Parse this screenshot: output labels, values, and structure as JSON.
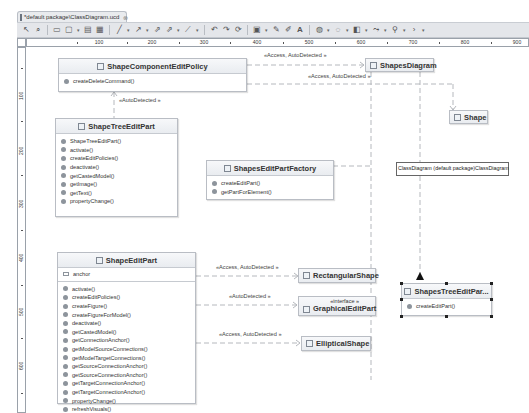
{
  "editor": {
    "tab_title": "*default package\\ClassDiagram.ucd",
    "tab_close": "⊗"
  },
  "toolbar": {
    "buttons": [
      "select-icon",
      "zoom-icon",
      "rectangle-icon",
      "note-icon",
      "dropdown",
      "class-icon",
      "package-icon",
      "line-icon",
      "dropdown",
      "arrow-icon",
      "dropdown",
      "association-icon",
      "inheritance-icon",
      "dropdown",
      "dependency-icon",
      "dropdown",
      "undo-icon",
      "redo-icon",
      "refresh-icon",
      "layout-icon",
      "dropdown",
      "pen-icon",
      "brush-icon",
      "font-icon",
      "fill-icon",
      "dropdown",
      "line-color-icon",
      "dropdown",
      "layer-icon",
      "dropdown",
      "route-icon",
      "dropdown",
      "arrange-icon",
      "dropdown",
      "more-icon"
    ]
  },
  "rulers": {
    "horizontal": [
      "100",
      "200",
      "300",
      "400",
      "500",
      "600",
      "700",
      "800",
      "900"
    ],
    "vertical": [
      "100",
      "200",
      "300",
      "400",
      "500",
      "600"
    ]
  },
  "classes": {
    "shape_component_edit_policy": {
      "name": "ShapeComponentEditPolicy",
      "methods": [
        "createDeleteCommand()"
      ]
    },
    "shape_tree_edit_part": {
      "name": "ShapeTreeEditPart",
      "methods": [
        "ShapeTreeEditPart()",
        "activate()",
        "createEditPolicies()",
        "deactivate()",
        "getCastedModel()",
        "getImage()",
        "getText()",
        "propertyChange()"
      ]
    },
    "shapes_edit_part_factory": {
      "name": "ShapesEditPartFactory",
      "methods": [
        "createEditPart()",
        "getPartForElement()"
      ]
    },
    "shape_edit_part": {
      "name": "ShapeEditPart",
      "fields": [
        "anchor"
      ],
      "methods": [
        "activate()",
        "createEditPolicies()",
        "createFigure()",
        "createFigureForModel()",
        "deactivate()",
        "getCastedModel()",
        "getConnectionAnchor()",
        "getModelSourceConnections()",
        "getModelTargetConnections()",
        "getSourceConnectionAnchor()",
        "getSourceConnectionAnchor()",
        "getTargetConnectionAnchor()",
        "getTargetConnectionAnchor()",
        "propertyChange()",
        "refreshVisuals()"
      ]
    },
    "shapes_tree_edit_part": {
      "name": "ShapesTreeEditPar...",
      "methods": [
        "createEditPart()"
      ]
    },
    "shapes_diagram": {
      "name": "ShapesDiagram"
    },
    "shape": {
      "name": "Shape"
    },
    "rectangular_shape": {
      "name": "RectangularShape"
    },
    "graphical_edit_part": {
      "name": "GraphicalEditPart",
      "stereotype": "«interface »"
    },
    "elliptical_shape": {
      "name": "EllipticalShape"
    }
  },
  "edge_labels": {
    "policy_to_diagram": "«Access, AutoDetected »",
    "tree_to_shape": "«Access, AutoDetected »",
    "tree_to_policy": "«AutoDetected »",
    "edit_to_rect": "«Access, AutoDetected »",
    "edit_to_gep": "«AutoDetected »",
    "edit_to_ellipse": "«Access, AutoDetected »"
  },
  "note": {
    "text": "ClassDiagram (default package)ClassDiagram"
  }
}
